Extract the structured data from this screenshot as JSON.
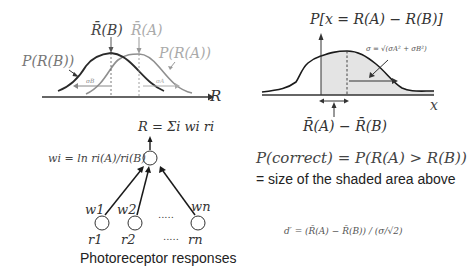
{
  "colors": {
    "dark_curve": "#2a2a2a",
    "light_curve": "#8f8f8f",
    "light_text": "#9a9a9a",
    "shaded_area": "#e4e4e4",
    "axis": "#333333",
    "text": "#333333"
  },
  "panel_top_left": {
    "mean_b_label": "R̄(B)",
    "mean_a_label": "R̄(A)",
    "p_rb_label": "P(R(B))",
    "p_ra_label": "P(R(A))",
    "sigma_b_label": "σB",
    "sigma_a_label": "σA",
    "axis_label": "R"
  },
  "panel_top_right": {
    "title": "P[x = R(A) − R(B)]",
    "sigma_label": "σ = √(σA² + σB²)",
    "axis_label": "x",
    "diff_label": "R̄(A) − R̄(B)"
  },
  "panel_bottom_left": {
    "sum_label": "R = Σi wi ri",
    "weight_formula": "wi = ln ri(A)/ri(B)",
    "weights": [
      "w1",
      "w2",
      "wn"
    ],
    "inputs": [
      "r1",
      "r2",
      "rn"
    ],
    "dots_top": ".....",
    "dots_bottom": ".....",
    "caption": "Photoreceptor responses"
  },
  "panel_bottom_right": {
    "p_correct": "P(correct) = P(R(A) > R(B))",
    "shaded_desc": "= size of the shaded area above",
    "dprime": "d′ = (R̄(A) − R̄(B)) / (σ/√2)"
  }
}
